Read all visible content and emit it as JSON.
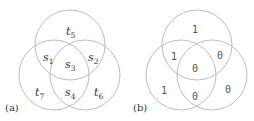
{
  "panels": [
    {
      "tag": "(a)",
      "regions": [
        {
          "name": "t",
          "sub": "5",
          "x": 70,
          "y": 35
        },
        {
          "name": "s",
          "sub": "1",
          "x": 47,
          "y": 62
        },
        {
          "name": "s",
          "sub": "2",
          "x": 92,
          "y": 62
        },
        {
          "name": "s",
          "sub": "3",
          "x": 69,
          "y": 70
        },
        {
          "name": "t",
          "sub": "7",
          "x": 38,
          "y": 98
        },
        {
          "name": "s",
          "sub": "4",
          "x": 69,
          "y": 99
        },
        {
          "name": "t",
          "sub": "6",
          "x": 97,
          "y": 99
        }
      ]
    },
    {
      "tag": "(b)",
      "regions": [
        {
          "value": "1",
          "x": 195,
          "y": 33
        },
        {
          "value": "1",
          "x": 174,
          "y": 61
        },
        {
          "value": "0",
          "x": 220,
          "y": 59
        },
        {
          "value": "0",
          "x": 195,
          "y": 72
        },
        {
          "value": "1",
          "x": 164,
          "y": 94
        },
        {
          "value": "0",
          "x": 195,
          "y": 100
        },
        {
          "value": "0",
          "x": 228,
          "y": 93
        }
      ]
    }
  ],
  "circles": {
    "a": [
      {
        "cx": 70,
        "cy": 45,
        "r": 35
      },
      {
        "cx": 54,
        "cy": 75,
        "r": 35
      },
      {
        "cx": 85,
        "cy": 75,
        "r": 35
      }
    ],
    "b": [
      {
        "cx": 197,
        "cy": 45,
        "r": 35
      },
      {
        "cx": 181,
        "cy": 75,
        "r": 35
      },
      {
        "cx": 212,
        "cy": 75,
        "r": 35
      }
    ]
  },
  "colors": {
    "stroke": "#bdbdbd",
    "text": "#333333"
  }
}
